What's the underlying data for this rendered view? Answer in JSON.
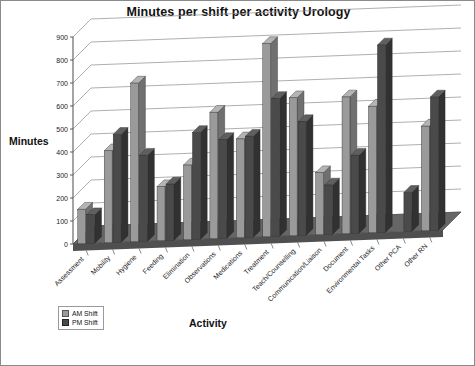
{
  "chart_data": {
    "type": "bar",
    "title": "Minutes per shift per activity Urology",
    "xlabel": "Activity",
    "ylabel": "Minutes",
    "ylim": [
      0,
      900
    ],
    "ytick_labels": [
      "0",
      "100",
      "200",
      "300",
      "400",
      "500",
      "600",
      "700",
      "800",
      "900"
    ],
    "yticks": [
      0,
      100,
      200,
      300,
      400,
      500,
      600,
      700,
      800,
      900
    ],
    "grid": true,
    "legend_position": "bottom-left",
    "three_d": true,
    "categories": [
      "Assessment",
      "Mobility",
      "Hygiene",
      "Feeding",
      "Elimination",
      "Observations",
      "Medications",
      "Treatment",
      "Teach/Counselling",
      "Communication/Liaison",
      "Document",
      "Environmental Tasks",
      "Other PCA",
      "Other RN"
    ],
    "series": [
      {
        "name": "AM Shift",
        "color": "#9a9a9a",
        "values": [
          150,
          400,
          690,
          235,
          325,
          550,
          430,
          840,
          600,
          270,
          595,
          550,
          0,
          455
        ]
      },
      {
        "name": "PM Shift",
        "color": "#4a4a4a",
        "values": [
          125,
          470,
          375,
          245,
          465,
          430,
          440,
          600,
          495,
          215,
          340,
          815,
          170,
          580
        ]
      }
    ],
    "legend": [
      {
        "label": "AM Shift",
        "color": "#9a9a9a"
      },
      {
        "label": "PM Shift",
        "color": "#4a4a4a"
      }
    ]
  },
  "colors": {
    "am_fill": "#9a9a9a",
    "am_side": "#707070",
    "am_top": "#b4b4b4",
    "pm_fill": "#4a4a4a",
    "pm_side": "#313131",
    "pm_top": "#5f5f5f",
    "floor": "#666666",
    "floor_front": "#4f4f4f",
    "gridline": "#8c8c8c",
    "axis": "#5a5a5a",
    "border": "#8a8a8a"
  }
}
